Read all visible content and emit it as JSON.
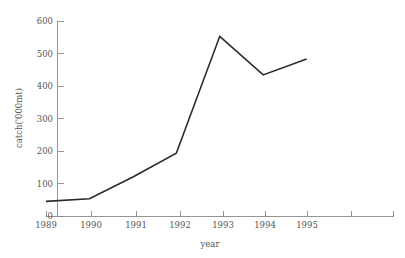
{
  "chart_data": {
    "type": "line",
    "title": "",
    "xlabel": "year",
    "ylabel": "catch('000mt)",
    "x": [
      1989,
      1990,
      1991,
      1992,
      1993,
      1994,
      1995
    ],
    "categories": [
      "1989",
      "1990",
      "1991",
      "1992",
      "1993",
      "1994",
      "1995"
    ],
    "values": [
      45,
      53,
      120,
      193,
      553,
      434,
      483
    ],
    "series": [
      {
        "name": "catch",
        "values": [
          45,
          53,
          120,
          193,
          553,
          434,
          483
        ]
      }
    ],
    "xlim": [
      1989,
      1997
    ],
    "ylim": [
      0,
      600
    ],
    "x_ticks": [
      "1989",
      "1990",
      "1991",
      "1992",
      "1993",
      "1994",
      "1995",
      "",
      ""
    ],
    "x_tick_values": [
      1989,
      1990,
      1991,
      1992,
      1993,
      1994,
      1995,
      1996,
      1997
    ],
    "y_ticks": [
      "0",
      "100",
      "200",
      "300",
      "400",
      "500",
      "600"
    ],
    "y_tick_values": [
      0,
      100,
      200,
      300,
      400,
      500,
      600
    ],
    "grid": false,
    "legend": "none",
    "line_color": "#2b2b2b",
    "axis_color": "#8a8a8a",
    "background_color": "#ffffff",
    "markers": false,
    "tick_direction": "in"
  },
  "axes": {
    "y_title": "catch('000mt)",
    "x_title": "year",
    "y_tick_labels": [
      "600",
      "500",
      "400",
      "300",
      "200",
      "100",
      "0"
    ],
    "x_tick_labels": [
      "1989",
      "1990",
      "1991",
      "1992",
      "1993",
      "1994",
      "1995"
    ]
  }
}
